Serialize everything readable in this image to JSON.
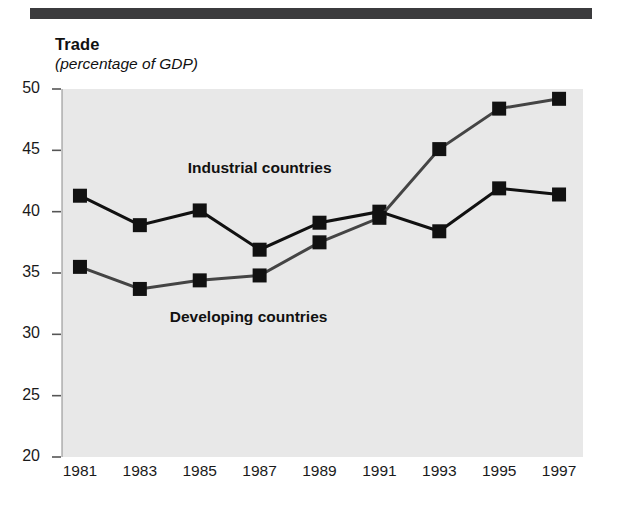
{
  "header": {
    "rule_color": "#3b3b3d"
  },
  "chart_data": {
    "type": "line",
    "title": "Trade",
    "subtitle": "(percentage of GDP)",
    "xlabel": "",
    "ylabel": "",
    "categories": [
      "1981",
      "1983",
      "1985",
      "1987",
      "1989",
      "1991",
      "1993",
      "1995",
      "1997"
    ],
    "x": [
      1981,
      1983,
      1985,
      1987,
      1989,
      1991,
      1993,
      1995,
      1997
    ],
    "xlim": [
      1980.4,
      1997.8
    ],
    "ylim": [
      20,
      50
    ],
    "ytick_labels": [
      "50",
      "45",
      "40",
      "35",
      "30",
      "25",
      "20"
    ],
    "yticks": [
      50,
      45,
      40,
      35,
      30,
      25,
      20
    ],
    "grid": false,
    "legend_position": "inline-annotations",
    "plot_background": "#e8e8e8",
    "series": [
      {
        "name": "Industrial countries",
        "color": "#111111",
        "marker": "square",
        "values": [
          41.3,
          38.9,
          40.1,
          36.9,
          39.1,
          40.0,
          38.4,
          41.9,
          41.4
        ]
      },
      {
        "name": "Developing countries",
        "color": "#444444",
        "marker": "square",
        "values": [
          35.5,
          33.7,
          34.4,
          34.8,
          37.5,
          39.5,
          45.1,
          48.4,
          49.2
        ]
      }
    ],
    "annotations": [
      {
        "text": "Industrial countries",
        "x": 1984.6,
        "y": 43.5
      },
      {
        "text": "Developing countries",
        "x": 1984.0,
        "y": 31.3
      }
    ]
  }
}
